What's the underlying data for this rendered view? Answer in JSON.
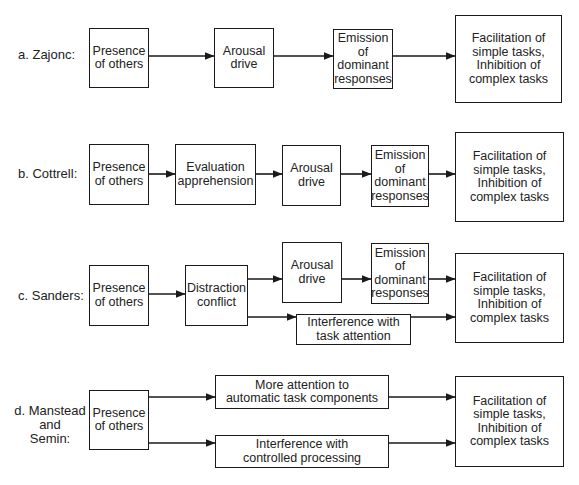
{
  "figure": {
    "rows": [
      {
        "id": "a",
        "label": "a. Zajonc:",
        "boxes": [
          "Presence\nof others",
          "Arousal\ndrive",
          "Emission\nof\ndominant\nresponses",
          "Facilitation of\nsimple tasks,\nInhibition of\ncomplex tasks"
        ]
      },
      {
        "id": "b",
        "label": "b. Cottrell:",
        "boxes": [
          "Presence\nof others",
          "Evaluation\napprehension",
          "Arousal\ndrive",
          "Emission\nof\ndominant\nresponses",
          "Facilitation of\nsimple tasks,\nInhibition of\ncomplex tasks"
        ]
      },
      {
        "id": "c",
        "label": "c. Sanders:",
        "boxes": [
          "Presence\nof others",
          "Distraction\nconflict",
          "Arousal\ndrive",
          "Emission\nof\ndominant\nresponses",
          "Interference with\ntask attention",
          "Facilitation of\nsimple tasks,\nInhibition of\ncomplex tasks"
        ]
      },
      {
        "id": "d",
        "label": "d. Manstead\nand\nSemin:",
        "boxes": [
          "Presence\nof others",
          "More attention to\nautomatic task components",
          "Interference with\ncontrolled processing",
          "Facilitation of\nsimple tasks,\nInhibition of\ncomplex tasks"
        ]
      }
    ],
    "colors": {
      "stroke": "#1a1a1a",
      "background": "#ffffff",
      "text": "#222222"
    }
  }
}
